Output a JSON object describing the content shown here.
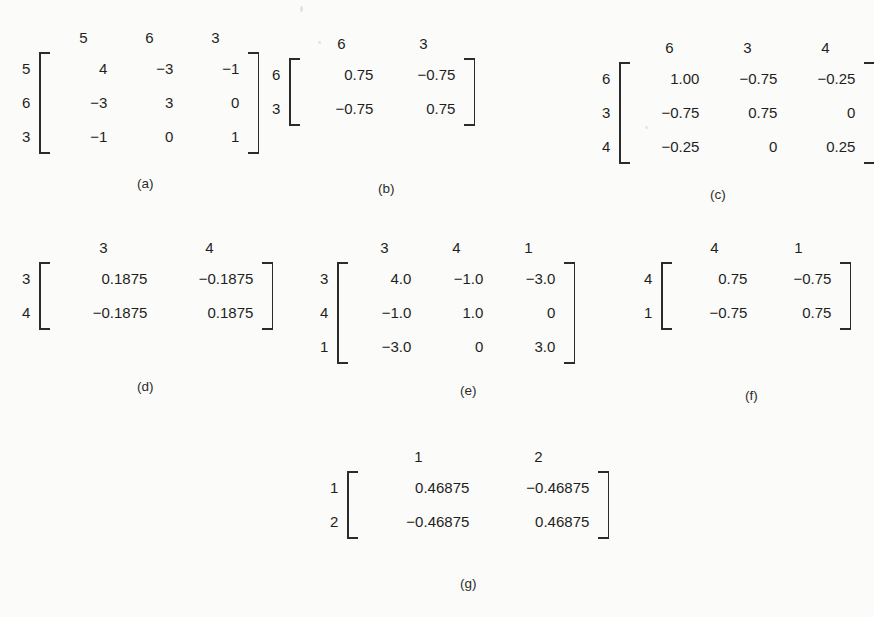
{
  "figure": {
    "background_color": "#fbfbf9",
    "ink_color": "#2b2b2b",
    "matrices": [
      {
        "id": "a",
        "caption": "(a)",
        "col_labels": [
          "5",
          "6",
          "3"
        ],
        "row_labels": [
          "5",
          "6",
          "3"
        ],
        "rows": [
          [
            "4",
            "−3",
            "−1"
          ],
          [
            "−3",
            "3",
            "0"
          ],
          [
            "−1",
            "0",
            "1"
          ]
        ]
      },
      {
        "id": "b",
        "caption": "(b)",
        "col_labels": [
          "6",
          "3"
        ],
        "row_labels": [
          "6",
          "3"
        ],
        "rows": [
          [
            "0.75",
            "−0.75"
          ],
          [
            "−0.75",
            "0.75"
          ]
        ]
      },
      {
        "id": "c",
        "caption": "(c)",
        "col_labels": [
          "6",
          "3",
          "4"
        ],
        "row_labels": [
          "6",
          "3",
          "4"
        ],
        "rows": [
          [
            "1.00",
            "−0.75",
            "−0.25"
          ],
          [
            "−0.75",
            "0.75",
            "0"
          ],
          [
            "−0.25",
            "0",
            "0.25"
          ]
        ]
      },
      {
        "id": "d",
        "caption": "(d)",
        "col_labels": [
          "3",
          "4"
        ],
        "row_labels": [
          "3",
          "4"
        ],
        "rows": [
          [
            "0.1875",
            "−0.1875"
          ],
          [
            "−0.1875",
            "0.1875"
          ]
        ]
      },
      {
        "id": "e",
        "caption": "(e)",
        "col_labels": [
          "3",
          "4",
          "1"
        ],
        "row_labels": [
          "3",
          "4",
          "1"
        ],
        "rows": [
          [
            "4.0",
            "−1.0",
            "−3.0"
          ],
          [
            "−1.0",
            "1.0",
            "0"
          ],
          [
            "−3.0",
            "0",
            "3.0"
          ]
        ]
      },
      {
        "id": "f",
        "caption": "(f)",
        "col_labels": [
          "4",
          "1"
        ],
        "row_labels": [
          "4",
          "1"
        ],
        "rows": [
          [
            "0.75",
            "−0.75"
          ],
          [
            "−0.75",
            "0.75"
          ]
        ]
      },
      {
        "id": "g",
        "caption": "(g)",
        "col_labels": [
          "1",
          "2"
        ],
        "row_labels": [
          "1",
          "2"
        ],
        "rows": [
          [
            "0.46875",
            "−0.46875"
          ],
          [
            "−0.46875",
            "0.46875"
          ]
        ]
      }
    ]
  },
  "layout": {
    "a": {
      "left": 22,
      "top": 30,
      "col_w": 66,
      "caption_left": 137,
      "caption_top": 176
    },
    "b": {
      "left": 272,
      "top": 36,
      "col_w": 82,
      "caption_left": 378,
      "caption_top": 181
    },
    "c": {
      "left": 602,
      "top": 40,
      "col_w": 78,
      "caption_left": 710,
      "caption_top": 187
    },
    "d": {
      "left": 22,
      "top": 240,
      "col_w": 106,
      "caption_left": 137,
      "caption_top": 379
    },
    "e": {
      "left": 320,
      "top": 240,
      "col_w": 72,
      "caption_left": 460,
      "caption_top": 383
    },
    "f": {
      "left": 644,
      "top": 240,
      "col_w": 84,
      "caption_left": 745,
      "caption_top": 388
    },
    "g": {
      "left": 330,
      "top": 449,
      "col_w": 120,
      "caption_left": 460,
      "caption_top": 576
    }
  }
}
